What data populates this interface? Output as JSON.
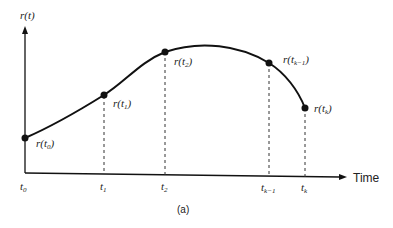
{
  "diagram": {
    "y_axis_label": "r(t)",
    "x_axis_label": "Time",
    "caption": "(a)",
    "points": [
      {
        "name": "t0",
        "base": "t",
        "sub": "0",
        "label_base": "r(t",
        "label_close": ")"
      },
      {
        "name": "t1",
        "base": "t",
        "sub": "1",
        "label_base": "r(t",
        "label_close": ")"
      },
      {
        "name": "t2",
        "base": "t",
        "sub": "2",
        "label_base": "r(t",
        "label_close": ")"
      },
      {
        "name": "tk-1",
        "base": "t",
        "sub": "k−1",
        "label_base": "r(t",
        "label_close": ")"
      },
      {
        "name": "tk",
        "base": "t",
        "sub": "k",
        "label_base": "r(t",
        "label_close": ")"
      }
    ],
    "colors": {
      "line": "#111111",
      "text": "#222222",
      "background": "#ffffff"
    }
  }
}
